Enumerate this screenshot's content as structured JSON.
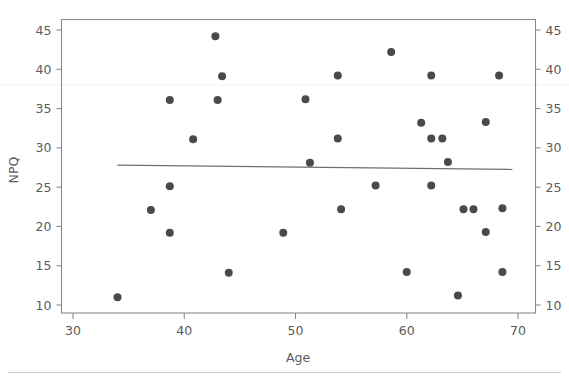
{
  "chart_data": {
    "type": "scatter",
    "title": "",
    "subtitle": "",
    "xlabel": "Age",
    "ylabel": "NPQ",
    "xlim": [
      30,
      71.5
    ],
    "ylim": [
      8.8,
      46.4
    ],
    "xticks": [
      30,
      40,
      50,
      60,
      70
    ],
    "yticks": [
      10,
      15,
      20,
      25,
      30,
      35,
      40,
      45
    ],
    "xtick_labels": [
      "30",
      "40",
      "50",
      "60",
      "70"
    ],
    "ytick_labels": [
      "10",
      "15",
      "20",
      "25",
      "30",
      "35",
      "40",
      "45"
    ],
    "right_axis_ticks": [
      10,
      15,
      20,
      25,
      30,
      35,
      40,
      45
    ],
    "right_axis_tick_labels": [
      "10",
      "15",
      "20",
      "25",
      "30",
      "35",
      "40",
      "45"
    ],
    "grid": false,
    "legend": null,
    "marker": {
      "shape": "circle",
      "color": "#4a4a4a",
      "size_px": 8
    },
    "series": [
      {
        "name": "NPQ vs Age",
        "points": [
          {
            "x": 34.0,
            "y": 11.0
          },
          {
            "x": 37.0,
            "y": 22.1
          },
          {
            "x": 38.7,
            "y": 36.1
          },
          {
            "x": 38.7,
            "y": 25.1
          },
          {
            "x": 38.7,
            "y": 19.2
          },
          {
            "x": 40.8,
            "y": 31.1
          },
          {
            "x": 42.8,
            "y": 44.2
          },
          {
            "x": 43.0,
            "y": 36.1
          },
          {
            "x": 43.4,
            "y": 39.1
          },
          {
            "x": 44.0,
            "y": 14.1
          },
          {
            "x": 48.9,
            "y": 19.2
          },
          {
            "x": 50.9,
            "y": 36.2
          },
          {
            "x": 51.3,
            "y": 28.1
          },
          {
            "x": 53.8,
            "y": 39.2
          },
          {
            "x": 53.8,
            "y": 31.2
          },
          {
            "x": 54.1,
            "y": 22.2
          },
          {
            "x": 57.2,
            "y": 25.2
          },
          {
            "x": 58.6,
            "y": 42.2
          },
          {
            "x": 60.0,
            "y": 14.2
          },
          {
            "x": 61.3,
            "y": 33.2
          },
          {
            "x": 62.2,
            "y": 39.2
          },
          {
            "x": 62.2,
            "y": 31.2
          },
          {
            "x": 62.2,
            "y": 25.2
          },
          {
            "x": 63.2,
            "y": 31.2
          },
          {
            "x": 63.7,
            "y": 28.2
          },
          {
            "x": 64.6,
            "y": 11.2
          },
          {
            "x": 65.1,
            "y": 22.2
          },
          {
            "x": 66.0,
            "y": 22.2
          },
          {
            "x": 67.1,
            "y": 19.3
          },
          {
            "x": 67.1,
            "y": 33.3
          },
          {
            "x": 68.3,
            "y": 39.2
          },
          {
            "x": 68.6,
            "y": 22.3
          },
          {
            "x": 68.6,
            "y": 14.2
          }
        ]
      }
    ],
    "fit_line": {
      "name": "linear fit",
      "x_start": 34.0,
      "y_start": 27.8,
      "x_end": 69.5,
      "y_end": 27.25,
      "color": "#6e6e6e"
    }
  },
  "colors": {
    "marker": "#4a4a4a",
    "axis": "#8a8a8a",
    "text": "#5b5b5b",
    "fit_line": "#6e6e6e",
    "footer_rule": "#c9c9c9",
    "background": "#ffffff"
  }
}
